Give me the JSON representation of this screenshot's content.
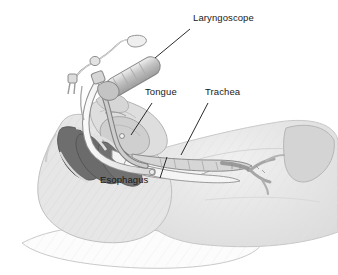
{
  "figure": {
    "background_color": "#ffffff",
    "width": 338,
    "height": 275,
    "style": "grayscale medical line illustration"
  },
  "labels": [
    {
      "id": "laryngoscope",
      "text": "Laryngoscope",
      "x": 193,
      "y": 18,
      "leader": {
        "x1": 190,
        "y1": 29,
        "x2": 155,
        "y2": 58
      }
    },
    {
      "id": "tongue",
      "text": "Tongue",
      "x": 145,
      "y": 92,
      "leader": {
        "x1": 152,
        "y1": 103,
        "x2": 131,
        "y2": 135
      }
    },
    {
      "id": "trachea",
      "text": "Trachea",
      "x": 205,
      "y": 92,
      "leader": {
        "x1": 208,
        "y1": 103,
        "x2": 181,
        "y2": 155
      }
    },
    {
      "id": "esophagus",
      "text": "Esophagus",
      "x": 100,
      "y": 180,
      "leader": {
        "x1": 160,
        "y1": 178,
        "x2": 167,
        "y2": 157
      }
    }
  ],
  "anatomy_parts": [
    {
      "name": "pillow",
      "fill": "#fbfbfb",
      "stroke": "#c9c9c9"
    },
    {
      "name": "head-and-neck-soft-tissue",
      "fill": "#e4e4e4",
      "stroke": "#bdbdbd"
    },
    {
      "name": "torso-chest",
      "fill": "#e9e9e9",
      "stroke": "#c4c4c4"
    },
    {
      "name": "shoulder-muscle",
      "fill": "#d2d2d2",
      "stroke": "#b5b5b5"
    },
    {
      "name": "cervical-vertebrae",
      "fill": "#6e6e6e",
      "stroke": "#5a5a5a"
    },
    {
      "name": "tongue-body",
      "fill": "#cfcfcf",
      "stroke": "#a8a8a8"
    },
    {
      "name": "pharynx-airway",
      "fill": "#f2f2f2",
      "stroke": "#9c9c9c"
    },
    {
      "name": "trachea-lumen",
      "fill": "#d8d8d8",
      "stroke": "#8e8e8e"
    },
    {
      "name": "esophagus-lumen",
      "fill": "#f4f4f4",
      "stroke": "#9a9a9a"
    },
    {
      "name": "bronchial-tree",
      "fill": "#c6c6c6",
      "stroke": "#8a8a8a"
    },
    {
      "name": "mandible-jaw",
      "fill": "#dcdcdc",
      "stroke": "#b0b0b0"
    }
  ],
  "device_parts": [
    {
      "name": "laryngoscope-handle",
      "fill": "#c8c8c8",
      "stroke": "#8c8c8c"
    },
    {
      "name": "laryngoscope-blade",
      "fill": "#bcbcbc",
      "stroke": "#888888"
    },
    {
      "name": "endotracheal-tube",
      "fill": "#e8e8e8",
      "stroke": "#888888"
    },
    {
      "name": "pilot-balloon-tubing",
      "fill": "#efefef",
      "stroke": "#999999"
    },
    {
      "name": "pilot-balloon",
      "fill": "#e0e0e0",
      "stroke": "#909090"
    },
    {
      "name": "tube-connector",
      "fill": "#d4d4d4",
      "stroke": "#8a8a8a"
    }
  ],
  "colors": {
    "vertebrae_dark": "#6e6e6e",
    "tissue_light": "#e4e4e4",
    "outline": "#b0b0b0",
    "label_text": "#1a1a1a",
    "leader_line": "#2b2b2b"
  }
}
